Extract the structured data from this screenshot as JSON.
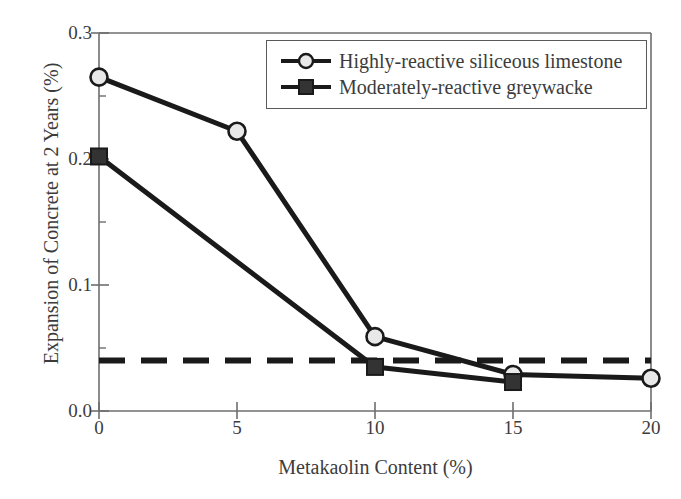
{
  "chart_data": {
    "type": "line",
    "title": "",
    "xlabel": "Metakaolin Content (%)",
    "ylabel": "Expansion of Concrete at 2 Years (%)",
    "xlim": [
      0,
      20
    ],
    "ylim": [
      0.0,
      0.3
    ],
    "xticks": [
      "0",
      "5",
      "10",
      "15",
      "20"
    ],
    "xtick_values": [
      0,
      5,
      10,
      15,
      20
    ],
    "yticks": [
      "0.0",
      "0.1",
      "0.2",
      "0.3"
    ],
    "ytick_values": [
      0.0,
      0.1,
      0.2,
      0.3
    ],
    "y_minor_tick_values": [
      0.05,
      0.15,
      0.25
    ],
    "grid": false,
    "legend_position": "upper-right",
    "series": [
      {
        "name": "Highly-reactive siliceous limestone",
        "marker": "circle-open",
        "marker_fill": "#e8e8e8",
        "line_color": "#1a1a1a",
        "x": [
          0,
          5,
          10,
          15,
          20
        ],
        "values": [
          0.265,
          0.222,
          0.059,
          0.029,
          0.026
        ]
      },
      {
        "name": "Moderately-reactive greywacke",
        "marker": "square-filled",
        "marker_fill": "#333333",
        "line_color": "#1a1a1a",
        "x": [
          0,
          10,
          15
        ],
        "values": [
          0.202,
          0.035,
          0.023
        ]
      }
    ],
    "annotations": [
      {
        "type": "horizontal-threshold-line",
        "style": "dashed",
        "value": 0.04,
        "color": "#1a1a1a"
      }
    ]
  },
  "legend": {
    "entries": [
      {
        "label": "Highly-reactive siliceous limestone"
      },
      {
        "label": "Moderately-reactive greywacke"
      }
    ]
  },
  "axes": {
    "x_title": "Metakaolin Content (%)",
    "y_title": "Expansion of Concrete at 2 Years (%)",
    "x_tick_labels": [
      "0",
      "5",
      "10",
      "15",
      "20"
    ],
    "y_tick_labels": [
      "0.0",
      "0.1",
      "0.2",
      "0.3"
    ]
  },
  "colors": {
    "line": "#1a1a1a",
    "axis": "#6e6e6e",
    "text": "#3c3c3c",
    "legend_border": "#5a5a5a",
    "marker_open_fill": "#e8e8e8",
    "marker_filled": "#333333"
  }
}
